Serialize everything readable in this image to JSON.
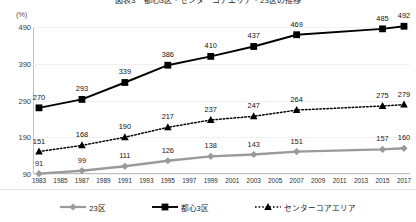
{
  "chart_data": {
    "type": "line",
    "title": "図表3　都心3区・センターコアエリア・23区の推移",
    "xlabel": "",
    "ylabel": "(%)",
    "yunit": "(%)",
    "ylim": [
      90,
      490
    ],
    "yticks": [
      90,
      190,
      290,
      390,
      490
    ],
    "grid": true,
    "legend_position": "bottom",
    "x": [
      1983,
      1985,
      1987,
      1989,
      1991,
      1993,
      1995,
      1997,
      1999,
      2001,
      2003,
      2005,
      2007,
      2009,
      2011,
      2013,
      2015,
      2017
    ],
    "xtick_labels": [
      "1983",
      "1985",
      "1987",
      "1989",
      "1991",
      "1993",
      "1995",
      "1997",
      "1999",
      "2001",
      "2003",
      "2005",
      "2007",
      "2009",
      "2011",
      "2013",
      "2015",
      "2017"
    ],
    "marker_years": [
      1983,
      1987,
      1991,
      1995,
      1999,
      2003,
      2007,
      2011,
      2015,
      2017
    ],
    "series": [
      {
        "name": "都心3区",
        "color": "#000000",
        "marker": "square",
        "linestyle": "solid",
        "x": [
          1983,
          1987,
          1991,
          1995,
          1999,
          2003,
          2007,
          2015,
          2017
        ],
        "values": [
          270,
          293,
          339,
          386,
          410,
          437,
          469,
          485,
          492
        ]
      },
      {
        "name": "センターコアエリア",
        "color": "#000000",
        "marker": "triangle",
        "linestyle": "dotted",
        "x": [
          1983,
          1987,
          1991,
          1995,
          1999,
          2003,
          2007,
          2015,
          2017
        ],
        "values": [
          151,
          168,
          190,
          217,
          237,
          247,
          264,
          275,
          279
        ]
      },
      {
        "name": "23区",
        "color": "#9a9a9a",
        "marker": "diamond",
        "linestyle": "solid",
        "x": [
          1983,
          1987,
          1991,
          1995,
          1999,
          2003,
          2007,
          2015,
          2017
        ],
        "values": [
          91,
          99,
          111,
          126,
          138,
          143,
          151,
          157,
          160
        ]
      }
    ]
  },
  "legend": {
    "items": [
      {
        "label": "23区",
        "marker": "diamond",
        "color": "#9a9a9a",
        "style": "solid"
      },
      {
        "label": "都心3区",
        "marker": "square",
        "color": "#000000",
        "style": "solid"
      },
      {
        "label": "センターコアエリア",
        "marker": "triangle",
        "color": "#000000",
        "style": "dotted"
      }
    ]
  }
}
